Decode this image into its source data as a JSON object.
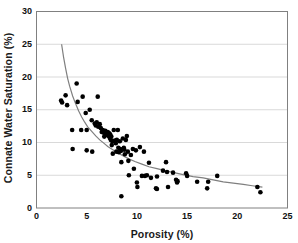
{
  "chart_data": {
    "type": "scatter",
    "title": "",
    "xlabel": "Porosity (%)",
    "ylabel": "Connate Water Saturation (%)",
    "xlim": [
      0,
      25
    ],
    "ylim": [
      0,
      30
    ],
    "xticks": [
      0,
      5,
      10,
      15,
      20,
      25
    ],
    "yticks": [
      0,
      5,
      10,
      15,
      20,
      25,
      30
    ],
    "grid": "horizontal",
    "grid_color": "#d9d9d9",
    "legend": null,
    "marker_color": "#000000",
    "marker_shape": "circle",
    "marker_size": 2.3,
    "trend": {
      "name": "power-law fit",
      "color": "#7f7f7f",
      "width": 1.2,
      "points": [
        [
          2.5,
          25.0
        ],
        [
          2.7,
          23.0
        ],
        [
          2.9,
          21.3
        ],
        [
          3.1,
          19.8
        ],
        [
          3.3,
          18.6
        ],
        [
          3.6,
          17.1
        ],
        [
          3.9,
          15.9
        ],
        [
          4.2,
          14.8
        ],
        [
          4.5,
          13.9
        ],
        [
          4.8,
          13.1
        ],
        [
          5.1,
          12.4
        ],
        [
          5.5,
          11.7
        ],
        [
          5.9,
          11.0
        ],
        [
          6.3,
          10.4
        ],
        [
          6.7,
          9.9
        ],
        [
          7.1,
          9.4
        ],
        [
          7.6,
          8.9
        ],
        [
          8.1,
          8.4
        ],
        [
          8.6,
          8.0
        ],
        [
          9.2,
          7.5
        ],
        [
          9.8,
          7.1
        ],
        [
          10.5,
          6.7
        ],
        [
          11.2,
          6.3
        ],
        [
          12.0,
          6.0
        ],
        [
          12.8,
          5.7
        ],
        [
          13.7,
          5.4
        ],
        [
          14.6,
          5.1
        ],
        [
          15.6,
          4.8
        ],
        [
          16.6,
          4.6
        ],
        [
          17.6,
          4.3
        ],
        [
          18.6,
          4.0
        ],
        [
          19.6,
          3.8
        ],
        [
          20.6,
          3.6
        ],
        [
          21.5,
          3.4
        ],
        [
          22.5,
          3.2
        ]
      ]
    },
    "points": [
      [
        2.45,
        16.4
      ],
      [
        2.55,
        16.1
      ],
      [
        2.9,
        17.2
      ],
      [
        3.05,
        15.7
      ],
      [
        3.55,
        11.9
      ],
      [
        3.6,
        9.0
      ],
      [
        4.0,
        19.0
      ],
      [
        4.1,
        16.2
      ],
      [
        4.45,
        11.9
      ],
      [
        4.6,
        17.0
      ],
      [
        4.9,
        14.5
      ],
      [
        5.0,
        11.9
      ],
      [
        5.0,
        8.8
      ],
      [
        5.3,
        15.0
      ],
      [
        5.5,
        13.4
      ],
      [
        5.55,
        8.6
      ],
      [
        5.8,
        12.9
      ],
      [
        5.9,
        12.6
      ],
      [
        6.0,
        13.1
      ],
      [
        6.1,
        17.0
      ],
      [
        6.15,
        12.4
      ],
      [
        6.3,
        12.8
      ],
      [
        6.4,
        12.2
      ],
      [
        6.5,
        11.6
      ],
      [
        6.6,
        11.9
      ],
      [
        6.7,
        11.5
      ],
      [
        6.75,
        10.9
      ],
      [
        6.85,
        11.8
      ],
      [
        6.9,
        11.3
      ],
      [
        6.95,
        11.6
      ],
      [
        7.0,
        11.4
      ],
      [
        7.05,
        11.1
      ],
      [
        7.1,
        11.6
      ],
      [
        7.15,
        11.2
      ],
      [
        7.2,
        11.0
      ],
      [
        7.25,
        11.4
      ],
      [
        7.3,
        10.7
      ],
      [
        7.35,
        11.2
      ],
      [
        7.4,
        10.4
      ],
      [
        7.45,
        10.9
      ],
      [
        7.5,
        9.6
      ],
      [
        7.55,
        10.2
      ],
      [
        7.6,
        8.3
      ],
      [
        7.7,
        11.9
      ],
      [
        7.8,
        10.3
      ],
      [
        7.9,
        9.9
      ],
      [
        7.95,
        8.6
      ],
      [
        8.0,
        10.4
      ],
      [
        8.1,
        11.9
      ],
      [
        8.15,
        9.2
      ],
      [
        8.2,
        8.5
      ],
      [
        8.3,
        10.2
      ],
      [
        8.35,
        9.0
      ],
      [
        8.4,
        8.7
      ],
      [
        8.45,
        7.0
      ],
      [
        8.45,
        1.8
      ],
      [
        8.6,
        10.6
      ],
      [
        8.7,
        9.2
      ],
      [
        8.75,
        8.9
      ],
      [
        8.8,
        8.2
      ],
      [
        8.9,
        10.4
      ],
      [
        9.0,
        11.0
      ],
      [
        9.1,
        8.6
      ],
      [
        9.15,
        7.2
      ],
      [
        9.2,
        5.0
      ],
      [
        9.4,
        8.1
      ],
      [
        9.6,
        9.0
      ],
      [
        9.7,
        6.0
      ],
      [
        9.9,
        8.8
      ],
      [
        10.0,
        3.9
      ],
      [
        10.05,
        3.2
      ],
      [
        10.3,
        9.3
      ],
      [
        10.5,
        4.9
      ],
      [
        10.7,
        8.6
      ],
      [
        10.8,
        4.9
      ],
      [
        11.0,
        5.0
      ],
      [
        11.2,
        6.9
      ],
      [
        11.4,
        4.6
      ],
      [
        11.9,
        3.0
      ],
      [
        12.0,
        2.9
      ],
      [
        12.0,
        4.8
      ],
      [
        12.6,
        5.7
      ],
      [
        12.9,
        7.0
      ],
      [
        13.0,
        5.5
      ],
      [
        13.1,
        3.2
      ],
      [
        13.6,
        5.4
      ],
      [
        13.9,
        4.3
      ],
      [
        14.0,
        3.9
      ],
      [
        14.05,
        4.1
      ],
      [
        14.9,
        5.3
      ],
      [
        15.0,
        4.9
      ],
      [
        16.0,
        4.0
      ],
      [
        17.0,
        3.0
      ],
      [
        17.1,
        4.0
      ],
      [
        18.0,
        4.9
      ],
      [
        22.0,
        3.2
      ],
      [
        22.3,
        2.4
      ]
    ]
  },
  "axes": {
    "x_ticks_text": [
      "0",
      "5",
      "10",
      "15",
      "20",
      "25"
    ],
    "y_ticks_text": [
      "0",
      "5",
      "10",
      "15",
      "20",
      "25",
      "30"
    ]
  }
}
